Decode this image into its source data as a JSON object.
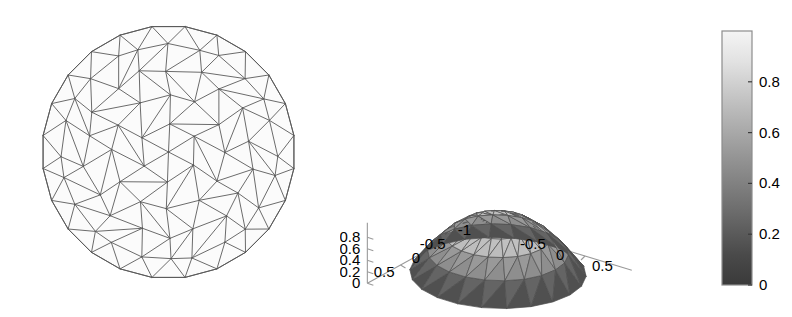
{
  "figure": {
    "background": "#ffffff",
    "width": 792,
    "height": 317
  },
  "panels": [
    {
      "name": "triangular-mesh-disk",
      "title": "",
      "description": "Unstructured triangular mesh of the unit disk"
    },
    {
      "name": "surface-plot-3d",
      "title": "",
      "description": "3D faceted surface over the unit disk, colored by height"
    }
  ],
  "chart_data": [
    {
      "type": "mesh",
      "title": "",
      "xlabel": "",
      "ylabel": "",
      "domain": "unit disk",
      "radius": 1.0,
      "boundary_nodes": 24,
      "interior_rings": [
        0.0,
        0.23,
        0.45,
        0.66,
        0.85,
        1.0
      ],
      "ring_counts": [
        1,
        6,
        12,
        18,
        24,
        24
      ],
      "edge_color": "#5a5a5a",
      "face_color": "#fbfbfb",
      "grid": false,
      "axes_visible": false
    },
    {
      "type": "surface",
      "title": "",
      "xlabel": "",
      "ylabel": "",
      "zlabel": "",
      "function": "z = 1 - r^2  (paraboloid cap over the unit disk)",
      "x_ticks": [
        "-0.5",
        "0",
        "0.5"
      ],
      "y_ticks": [
        "0.5",
        "0",
        "-0.5",
        "-1"
      ],
      "z_ticks": [
        "0",
        "0.2",
        "0.4",
        "0.6",
        "0.8"
      ],
      "xlim": [
        -1,
        1
      ],
      "ylim": [
        -1,
        1
      ],
      "zlim": [
        0,
        1
      ],
      "colormap": "gray",
      "shading": "faceted",
      "colorbar": {
        "ticks": [
          "0",
          "0.2",
          "0.4",
          "0.6",
          "0.8"
        ],
        "tick_values": [
          0,
          0.2,
          0.4,
          0.6,
          0.8
        ],
        "range": [
          0,
          1
        ],
        "orientation": "vertical",
        "low_color": "#3d3d3d",
        "high_color": "#f2f2f2"
      }
    }
  ],
  "colorbar": {
    "labels": [
      "0.8",
      "0.6",
      "0.4",
      "0.2",
      "0"
    ]
  },
  "surface_axes": {
    "z_labels": [
      "0.8",
      "0.6",
      "0.4",
      "0.2",
      "0"
    ],
    "y_labels": [
      "0.5",
      "0",
      "-0.5",
      "-1"
    ],
    "x_labels": [
      "-0.5",
      "0",
      "0.5"
    ]
  }
}
